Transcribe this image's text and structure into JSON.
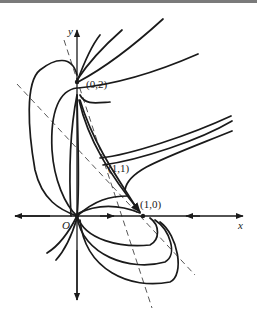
{
  "figure": {
    "type": "phase-portrait",
    "axes": {
      "x_label": "x",
      "y_label": "y",
      "origin_label": "O"
    },
    "equilibria": [
      {
        "label": "(0,2)",
        "x": 0,
        "y": 2
      },
      {
        "label": "(1,1)",
        "x": 1,
        "y": 1
      },
      {
        "label": "(1,0)",
        "x": 1,
        "y": 0
      },
      {
        "label": "O",
        "x": 0,
        "y": 0
      }
    ],
    "isoclines": [
      "dashed-line-1",
      "dashed-line-2"
    ],
    "colors": {
      "stroke": "#1a1a1a",
      "background": "#ffffff",
      "top_bar": "#7a7a7a"
    }
  }
}
